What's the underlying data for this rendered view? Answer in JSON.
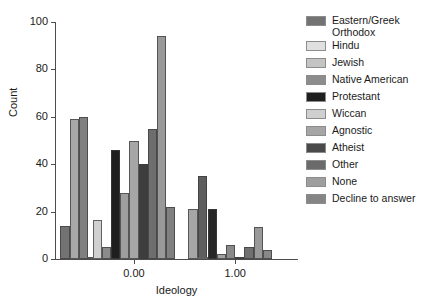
{
  "chart_data": {
    "type": "bar",
    "title": "",
    "subtitle": "",
    "xlabel": "Ideology",
    "ylabel": "Count",
    "ylim": [
      0,
      100
    ],
    "yticks": [
      0,
      20,
      40,
      60,
      80,
      100
    ],
    "ytick_labels": [
      "0",
      "20",
      "40",
      "60",
      "80",
      "100"
    ],
    "xticks": [
      0.0,
      1.0
    ],
    "xtick_labels": [
      "0.00",
      "1.00"
    ],
    "xlim": [
      -0.78,
      1.62
    ],
    "grid": false,
    "legend_position": "right",
    "orientation": "vertical",
    "series": [
      {
        "name": "Eastern/Greek Orthodox",
        "color": "#737373"
      },
      {
        "name": "Hindu",
        "color": "#d9d9d9"
      },
      {
        "name": "Jewish",
        "color": "#bfbfbf"
      },
      {
        "name": "Native American",
        "color": "#8c8c8c"
      },
      {
        "name": "Protestant",
        "color": "#1a1a1a"
      },
      {
        "name": "Wiccan",
        "color": "#cccccc"
      },
      {
        "name": "Agnostic",
        "color": "#a6a6a6"
      },
      {
        "name": "Atheist",
        "color": "#4d4d4d"
      },
      {
        "name": "Other",
        "color": "#666666"
      },
      {
        "name": "None",
        "color": "#999999"
      },
      {
        "name": "Decline to answer",
        "color": "#808080"
      }
    ],
    "clusters": [
      {
        "x": -0.5,
        "bars": [
          {
            "series": "Eastern/Greek Orthodox",
            "value": 14,
            "color": "#737373"
          },
          {
            "series": "Wiccan",
            "value": 59,
            "color": "#a8a8a8"
          },
          {
            "series": "Agnostic",
            "value": 60,
            "color": "#808080"
          },
          {
            "series": "Atheist",
            "value": 0.7,
            "color": "#9a9a9a"
          },
          {
            "series": "Other",
            "value": 1,
            "color": "#bdbdbd"
          }
        ]
      },
      {
        "x": 0.0,
        "bars": [
          {
            "series": "Jewish",
            "value": 16.5,
            "color": "#d0d0d0"
          },
          {
            "series": "Native American",
            "value": 5,
            "color": "#8c8c8c"
          },
          {
            "series": "Protestant",
            "value": 46,
            "color": "#1f1f1f"
          },
          {
            "series": "Wiccan",
            "value": 28,
            "color": "#9e9e9e"
          },
          {
            "series": "Agnostic",
            "value": 50,
            "color": "#a6a6a6"
          },
          {
            "series": "Atheist",
            "value": 40,
            "color": "#3d3d3d"
          },
          {
            "series": "Other",
            "value": 55,
            "color": "#6e6e6e"
          },
          {
            "series": "None",
            "value": 94,
            "color": "#999999"
          },
          {
            "series": "Decline to answer",
            "value": 22,
            "color": "#808080"
          }
        ]
      },
      {
        "x": 0.72,
        "bars": [
          {
            "series": "Agnostic",
            "value": 21,
            "color": "#a6a6a6"
          },
          {
            "series": "Other",
            "value": 35,
            "color": "#5e5e5e"
          },
          {
            "series": "None",
            "value": 1,
            "color": "#999999"
          },
          {
            "series": "Decline to answer",
            "value": 0.5,
            "color": "#808080"
          }
        ]
      },
      {
        "x": 1.0,
        "bars": [
          {
            "series": "Hindu",
            "value": 0.6,
            "color": "#c9c9c9"
          },
          {
            "series": "Protestant",
            "value": 21,
            "color": "#262626"
          },
          {
            "series": "Wiccan",
            "value": 2,
            "color": "#a0a0a0"
          },
          {
            "series": "Agnostic",
            "value": 6,
            "color": "#8a8a8a"
          },
          {
            "series": "Atheist",
            "value": 1,
            "color": "#4d4d4d"
          },
          {
            "series": "Other",
            "value": 5,
            "color": "#707070"
          },
          {
            "series": "None",
            "value": 13.5,
            "color": "#999999"
          },
          {
            "series": "Decline to answer",
            "value": 4,
            "color": "#888888"
          }
        ]
      }
    ]
  },
  "legend": {
    "items": [
      {
        "label": "Eastern/Greek\nOrthodox",
        "color": "#737373"
      },
      {
        "label": "Hindu",
        "color": "#e0e0e0"
      },
      {
        "label": "Jewish",
        "color": "#c4c4c4"
      },
      {
        "label": "Native American",
        "color": "#8c8c8c"
      },
      {
        "label": "Protestant",
        "color": "#1f1f1f"
      },
      {
        "label": "Wiccan",
        "color": "#cfcfcf"
      },
      {
        "label": "Agnostic",
        "color": "#a6a6a6"
      },
      {
        "label": "Atheist",
        "color": "#4a4a4a"
      },
      {
        "label": "Other",
        "color": "#6b6b6b"
      },
      {
        "label": "None",
        "color": "#9e9e9e"
      },
      {
        "label": "Decline to answer",
        "color": "#858585"
      }
    ]
  }
}
